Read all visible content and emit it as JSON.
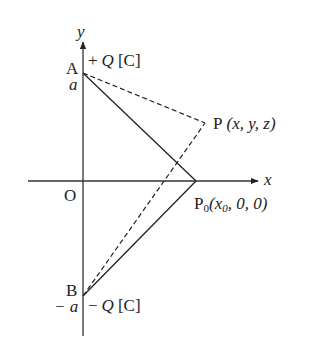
{
  "figure": {
    "axes": {
      "x_label": "x",
      "y_label": "y",
      "origin_label": "O"
    },
    "points": {
      "A": {
        "name": "A",
        "coord_label": "a",
        "charge_sign": "+",
        "charge_symbol": "Q",
        "charge_unit": "[C]"
      },
      "B": {
        "name": "B",
        "coord_label": "− a",
        "charge_sign": "−",
        "charge_symbol": "Q",
        "charge_unit": "[C]"
      },
      "P": {
        "name": "P",
        "coords": "(x, y, z)"
      },
      "P0": {
        "name": "P",
        "subscript": "0",
        "coords_open": "(x",
        "coords_sub": "0",
        "coords_rest": ", 0, 0)"
      }
    },
    "lines": [
      {
        "from": "A",
        "to": "P0",
        "style": "solid"
      },
      {
        "from": "B",
        "to": "P0",
        "style": "solid"
      },
      {
        "from": "A",
        "to": "P",
        "style": "dashed"
      },
      {
        "from": "B",
        "to": "P",
        "style": "dashed"
      }
    ],
    "colors": {
      "ink": "#222222",
      "background": "#ffffff"
    }
  }
}
